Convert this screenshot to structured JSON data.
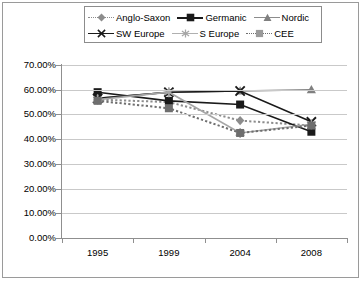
{
  "chart_data": {
    "type": "line",
    "title": "",
    "xlabel": "",
    "ylabel": "",
    "categories": [
      "1995",
      "1999",
      "2004",
      "2008"
    ],
    "ylim": [
      0,
      70
    ],
    "ytick_labels": [
      "0.00%",
      "10.00%",
      "20.00%",
      "30.00%",
      "40.00%",
      "50.00%",
      "60.00%",
      "70.00%"
    ],
    "ytick_values": [
      0,
      10,
      20,
      30,
      40,
      50,
      60,
      70
    ],
    "grid": true,
    "legend_position": "top",
    "series": [
      {
        "name": "Anglo-Saxon",
        "values": [
          56.0,
          55.0,
          47.5,
          45.5
        ],
        "color": "#8c8c8c",
        "line_style": "dotted",
        "marker": "diamond"
      },
      {
        "name": "Germanic",
        "values": [
          59.0,
          55.5,
          54.0,
          43.0
        ],
        "color": "#1a1a1a",
        "line_style": "solid",
        "marker": "square"
      },
      {
        "name": "Nordic",
        "values": [
          56.5,
          59.0,
          59.5,
          60.0
        ],
        "color": "#808080",
        "line_style": "solid",
        "marker": "triangle"
      },
      {
        "name": "SW Europe",
        "values": [
          56.5,
          59.0,
          59.5,
          47.0
        ],
        "color": "#1a1a1a",
        "line_style": "solid",
        "marker": "cross"
      },
      {
        "name": "S Europe",
        "values": [
          56.0,
          59.0,
          42.5,
          46.0
        ],
        "color": "#a6a6a6",
        "line_style": "solid",
        "marker": "asterisk"
      },
      {
        "name": "CEE",
        "values": [
          55.5,
          52.5,
          42.5,
          45.5
        ],
        "color": "#6e6e6e",
        "line_style": "dotted",
        "marker": "square"
      }
    ]
  },
  "legend": {
    "rows": [
      [
        "Anglo-Saxon",
        "Germanic",
        "Nordic"
      ],
      [
        "SW Europe",
        "S Europe",
        "CEE"
      ]
    ]
  }
}
